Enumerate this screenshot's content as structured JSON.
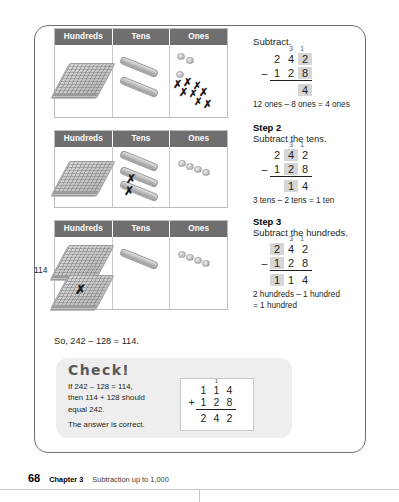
{
  "page": {
    "number": "68",
    "chapter": "Chapter 3",
    "chapter_title": "Subtraction up to 1,000"
  },
  "place_value_charts": {
    "headers": [
      "Hundreds",
      "Tens",
      "Ones"
    ],
    "rows": [
      {
        "label": "",
        "hundreds_flats": 1,
        "tens_rods": 2,
        "ones_units": 3,
        "ones_crossed": 8,
        "tens_crossed": 0,
        "hundreds_crossed": 0
      },
      {
        "label": "",
        "hundreds_flats": 1,
        "tens_rods": 3,
        "ones_units": 4,
        "ones_crossed": 0,
        "tens_crossed": 2,
        "hundreds_crossed": 0
      },
      {
        "label": "114",
        "hundreds_flats": 2,
        "tens_rods": 1,
        "ones_units": 4,
        "ones_crossed": 0,
        "tens_crossed": 0,
        "hundreds_crossed": 1
      }
    ]
  },
  "conclusion": "So, 242 – 128 = 114.",
  "check": {
    "title": "Check!",
    "line1": "If 242 – 128 = 114,",
    "line2": "then 114 + 128 should",
    "line3": "equal 242.",
    "line4": "The answer is correct.",
    "sum": {
      "carry": [
        "",
        "1",
        ""
      ],
      "addend1": [
        "1",
        "1",
        "4"
      ],
      "addend2": [
        "1",
        "2",
        "8"
      ],
      "operator": "+",
      "total": [
        "2",
        "4",
        "2"
      ]
    }
  },
  "steps": [
    {
      "id": "step1",
      "heading": "",
      "instruction": "Subtract.",
      "minuend": [
        "2",
        "4",
        "2"
      ],
      "subtrahend": [
        "1",
        "2",
        "8"
      ],
      "operator": "–",
      "regroup": [
        "",
        "3",
        "1"
      ],
      "difference": [
        "",
        "",
        "4"
      ],
      "highlight": [
        false,
        false,
        true
      ],
      "note": "12 ones – 8 ones = 4 ones"
    },
    {
      "id": "step2",
      "heading": "Step 2",
      "instruction": "Subtract the tens.",
      "minuend": [
        "2",
        "4",
        "2"
      ],
      "subtrahend": [
        "1",
        "2",
        "8"
      ],
      "operator": "–",
      "regroup": [
        "",
        "3",
        "1"
      ],
      "difference": [
        "",
        "1",
        "4"
      ],
      "highlight": [
        false,
        true,
        false
      ],
      "note": "3 tens – 2 tens = 1 ten"
    },
    {
      "id": "step3",
      "heading": "Step 3",
      "instruction": "Subtract the hundreds.",
      "minuend": [
        "2",
        "4",
        "2"
      ],
      "subtrahend": [
        "1",
        "2",
        "8"
      ],
      "operator": "–",
      "regroup": [
        "",
        "3",
        "1"
      ],
      "difference": [
        "1",
        "1",
        "4"
      ],
      "highlight": [
        true,
        false,
        false
      ],
      "note_line1": "2 hundreds – 1 hundred",
      "note_line2": "= 1 hundred"
    }
  ],
  "colors": {
    "header_bg": "#6f6f6f",
    "header_text": "#ffffff",
    "highlight": "#d6d6d6",
    "check_bg": "#eeeeee",
    "frame_border": "#6e6e73"
  }
}
